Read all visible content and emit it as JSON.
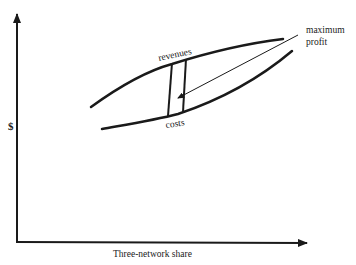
{
  "diagram": {
    "axes": {
      "y_label": "$",
      "x_label": "Three-network share"
    },
    "curves": {
      "revenues_label": "revenues",
      "costs_label": "costs"
    },
    "annotation": {
      "line1": "maximum",
      "line2": "profit"
    },
    "colors": {
      "ink": "#1a1a1a",
      "background": "#ffffff"
    }
  }
}
